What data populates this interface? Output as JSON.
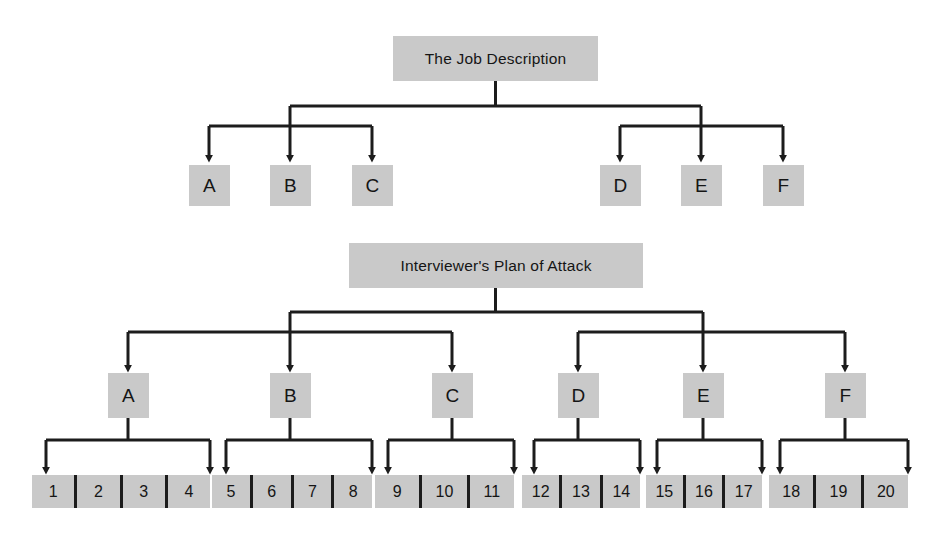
{
  "diagram": {
    "title_top": "The Job Description",
    "title_bottom": "Interviewer's Plan of Attack",
    "colors": {
      "box_fill": "#c9c9c9",
      "line": "#1c1c1c",
      "text": "#151515",
      "background": "#ffffff"
    },
    "top_tree": {
      "root_label": "The Job Description",
      "children": [
        {
          "label": "A"
        },
        {
          "label": "B"
        },
        {
          "label": "C"
        },
        {
          "label": "D"
        },
        {
          "label": "E"
        },
        {
          "label": "F"
        }
      ]
    },
    "bottom_tree": {
      "root_label": "Interviewer's Plan of Attack",
      "children": [
        {
          "label": "A",
          "items": [
            "1",
            "2",
            "3",
            "4"
          ]
        },
        {
          "label": "B",
          "items": [
            "5",
            "6",
            "7",
            "8"
          ]
        },
        {
          "label": "C",
          "items": [
            "9",
            "10",
            "11"
          ]
        },
        {
          "label": "D",
          "items": [
            "12",
            "13",
            "14"
          ]
        },
        {
          "label": "E",
          "items": [
            "15",
            "16",
            "17"
          ]
        },
        {
          "label": "F",
          "items": [
            "18",
            "19",
            "20"
          ]
        }
      ]
    }
  }
}
